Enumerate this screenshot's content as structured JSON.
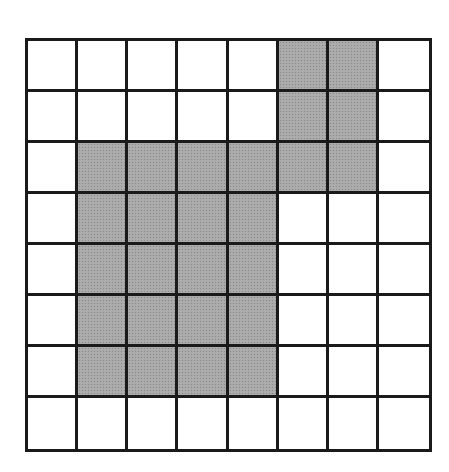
{
  "grid": {
    "rows": 8,
    "cols": 8,
    "shaded_color": "#a9a9a9",
    "line_color": "#1a1a1a",
    "background_color": "#ffffff",
    "cells": [
      [
        0,
        0,
        0,
        0,
        0,
        1,
        1,
        0
      ],
      [
        0,
        0,
        0,
        0,
        0,
        1,
        1,
        0
      ],
      [
        0,
        1,
        1,
        1,
        1,
        1,
        1,
        0
      ],
      [
        0,
        1,
        1,
        1,
        1,
        0,
        0,
        0
      ],
      [
        0,
        1,
        1,
        1,
        1,
        0,
        0,
        0
      ],
      [
        0,
        1,
        1,
        1,
        1,
        0,
        0,
        0
      ],
      [
        0,
        1,
        1,
        1,
        1,
        0,
        0,
        0
      ],
      [
        0,
        0,
        0,
        0,
        0,
        0,
        0,
        0
      ]
    ],
    "shaded_count": 26
  }
}
